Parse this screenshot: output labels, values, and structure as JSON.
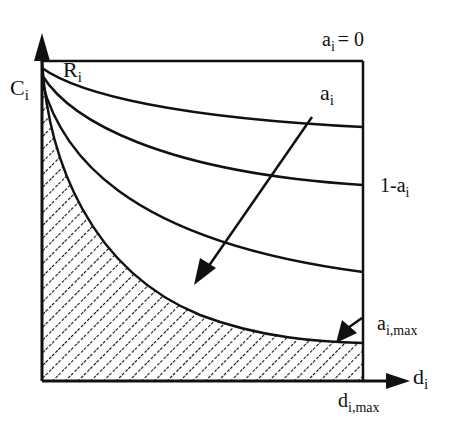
{
  "diagram": {
    "type": "curve-family-plot",
    "axes": {
      "y_label_top": "R",
      "y_label_top_sub": "i",
      "y_label_side": "C",
      "y_label_side_sub": "i",
      "x_label": "d",
      "x_label_sub": "i",
      "x_max_label": "d",
      "x_max_label_sub": "i,max"
    },
    "annotations": {
      "top_curve": "a",
      "top_curve_sub": "i",
      "top_curve_eq": "= 0",
      "arrow_label": "a",
      "arrow_label_sub": "i",
      "right_label_prefix": "1-a",
      "right_label_sub": "i",
      "bottom_curve": "a",
      "bottom_curve_sub": "i,max"
    },
    "curves": [
      {
        "name": "a_i = 0",
        "description": "horizontal line at top (R_i)"
      },
      {
        "name": "curve-1",
        "end_y_fraction": 0.2
      },
      {
        "name": "curve-2",
        "end_y_fraction": 0.39
      },
      {
        "name": "curve-3",
        "end_y_fraction": 0.66
      },
      {
        "name": "a_i,max",
        "end_y_fraction": 0.88,
        "hatched_below": true
      }
    ],
    "colors": {
      "line": "#111111",
      "background": "#ffffff"
    }
  }
}
